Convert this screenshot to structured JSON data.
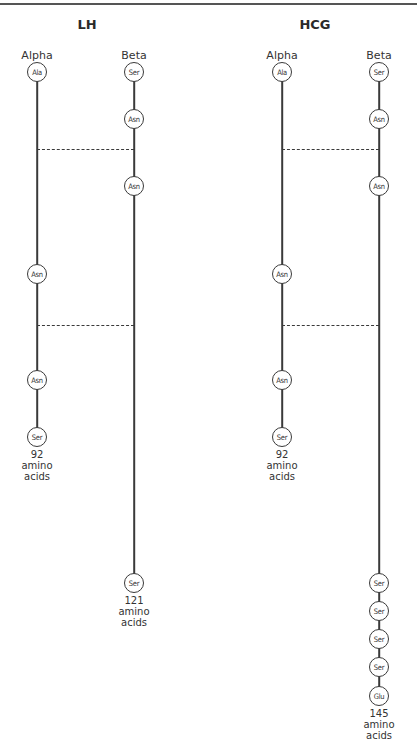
{
  "figure": {
    "panels": [
      {
        "title": "LH",
        "chains": [
          {
            "label": "Alpha",
            "residues": [
              "Ala",
              "Asn",
              "Asn",
              "Ser"
            ],
            "count_number": "92",
            "count_text1": "amino",
            "count_text2": "acids"
          },
          {
            "label": "Beta",
            "residues": [
              "Ser",
              "Asn",
              "Asn",
              "Ser"
            ],
            "count_number": "121",
            "count_text1": "amino",
            "count_text2": "acids"
          }
        ]
      },
      {
        "title": "HCG",
        "chains": [
          {
            "label": "Alpha",
            "residues": [
              "Ala",
              "Asn",
              "Asn",
              "Ser"
            ],
            "count_number": "92",
            "count_text1": "amino",
            "count_text2": "acids"
          },
          {
            "label": "Beta",
            "residues": [
              "Ser",
              "Asn",
              "Asn",
              "Ser",
              "Ser",
              "Ser",
              "Ser",
              "Glu"
            ],
            "count_number": "145",
            "count_text1": "amino",
            "count_text2": "acids"
          }
        ]
      }
    ],
    "disulfide_bridges": 2
  }
}
